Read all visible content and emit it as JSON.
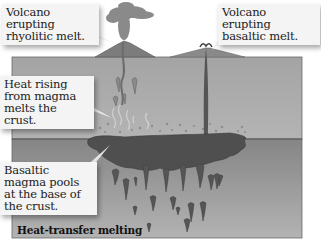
{
  "diagram": {
    "title": "Heat-transfer melting",
    "callouts": {
      "rhyolitic": "Volcano erupting rhyolitic melt.",
      "basaltic": "Volcano erupting basaltic melt.",
      "heat": "Heat rising from magma melts the crust.",
      "pool": "Basaltic magma pools at the base of the crust."
    },
    "colors": {
      "crust": "#a9a9a9",
      "mantle": "#8d8d8d",
      "magma": "#4d4d4d",
      "volcano": "#7a7a7a",
      "ash": "#8a8a8a",
      "callout_bg": "#f4f4f4"
    }
  }
}
